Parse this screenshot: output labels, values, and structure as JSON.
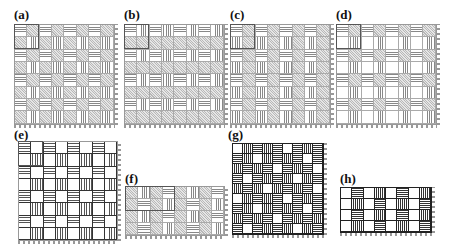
{
  "figure": {
    "panels": [
      {
        "id": "a",
        "label": "(a)",
        "x": 14,
        "y": 8,
        "gx": 14,
        "gy": 24,
        "cols": 8,
        "rows": 8,
        "cell": 12.6,
        "style": "light",
        "unit_cells": 2,
        "pattern": [
          "HDHDHDHD",
          "DVDVDVDV",
          "HDHDHDHD",
          "DVDVDVDV",
          "HDHDHDHD",
          "DVDVDVDV",
          "HDHDHDHD",
          "DVDVDVDV"
        ]
      },
      {
        "id": "b",
        "label": "(b)",
        "x": 124,
        "y": 8,
        "gx": 124,
        "gy": 24,
        "cols": 8,
        "rows": 8,
        "cell": 12.6,
        "style": "light",
        "unit_cells": 2,
        "pattern": [
          "HVHVHVHV",
          "DDDDDDDD",
          "HVHVHVHV",
          "DDDDDDDD",
          "HVHVHVHV",
          "DDDDDDDD",
          "HVHVHVHV",
          "DDDDDDDD"
        ]
      },
      {
        "id": "c",
        "label": "(c)",
        "x": 230,
        "y": 8,
        "gx": 230,
        "gy": 24,
        "cols": 8,
        "rows": 8,
        "cell": 12.6,
        "style": "light",
        "unit_cells": 2,
        "pattern": [
          "HDHDHDHD",
          "VDVDVDVD",
          "HDHDHDHD",
          "VDVDVDVD",
          "HDHDHDHD",
          "VDVDVDVD",
          "HDHDHDHD",
          "VDVDVDVD"
        ]
      },
      {
        "id": "d",
        "label": "(d)",
        "x": 336,
        "y": 8,
        "gx": 336,
        "gy": 24,
        "cols": 8,
        "rows": 8,
        "cell": 12.6,
        "style": "light",
        "unit_cells": 2,
        "pattern": [
          "HDHDHDHD",
          "WVWVWVWV",
          "HDHDHDHD",
          "WVWVWVWV",
          "HDHDHDHD",
          "WVWVWVWV",
          "HDHDHDHD",
          "WVWVWVWV"
        ]
      },
      {
        "id": "e",
        "label": "(e)",
        "x": 14,
        "y": 128,
        "gx": 18,
        "gy": 141,
        "cols": 8,
        "rows": 8,
        "cell": 12.5,
        "style": "bold",
        "unit_cells": 2,
        "pattern": [
          "HWHWHWHW",
          "WVWVWVWV",
          "HWHWHWHW",
          "WVWVWVWV",
          "HWHWHWHW",
          "WVWVWVWV",
          "HWHWHWHW",
          "WVWVWVWV"
        ]
      },
      {
        "id": "f",
        "label": "(f)",
        "x": 125,
        "y": 172,
        "gx": 125,
        "gy": 186,
        "cols": 8,
        "rows": 4,
        "cell": 12.5,
        "style": "light",
        "unit_cells": 4,
        "pattern": [
          "DVDHDVDH",
          "DHDVDHDV",
          "DVDHDVDH",
          "DHDVDHDV"
        ]
      },
      {
        "id": "g",
        "label": "(g)",
        "x": 228,
        "y": 128,
        "gx": 232,
        "gy": 143,
        "cols": 9,
        "rows": 9,
        "cell": 10.2,
        "style": "dark",
        "unit_cells": 0,
        "pattern": [
          "WVHVHWHVH",
          "HVWVHVHWH",
          "VHVHWHVHW",
          "HWHVHVWVH",
          "VHVWVHVHW",
          "WVHVHWHVH",
          "HVWVHVHWH",
          "VHVHWHVHV",
          "HWHVHVWVH"
        ]
      },
      {
        "id": "h",
        "label": "(h)",
        "x": 340,
        "y": 172,
        "gx": 340,
        "gy": 187,
        "cols": 8,
        "rows": 4,
        "cell": 11.5,
        "style": "dark",
        "unit_cells": 0,
        "pattern": [
          "WHWVWHWV",
          "WVWHWVWH",
          "WHWVWHWV",
          "WVWHWVWH"
        ]
      }
    ],
    "legend_key": {
      "H": "horizontal hatch",
      "V": "vertical hatch",
      "D": "diagonal hatch",
      "W": "blank"
    }
  }
}
